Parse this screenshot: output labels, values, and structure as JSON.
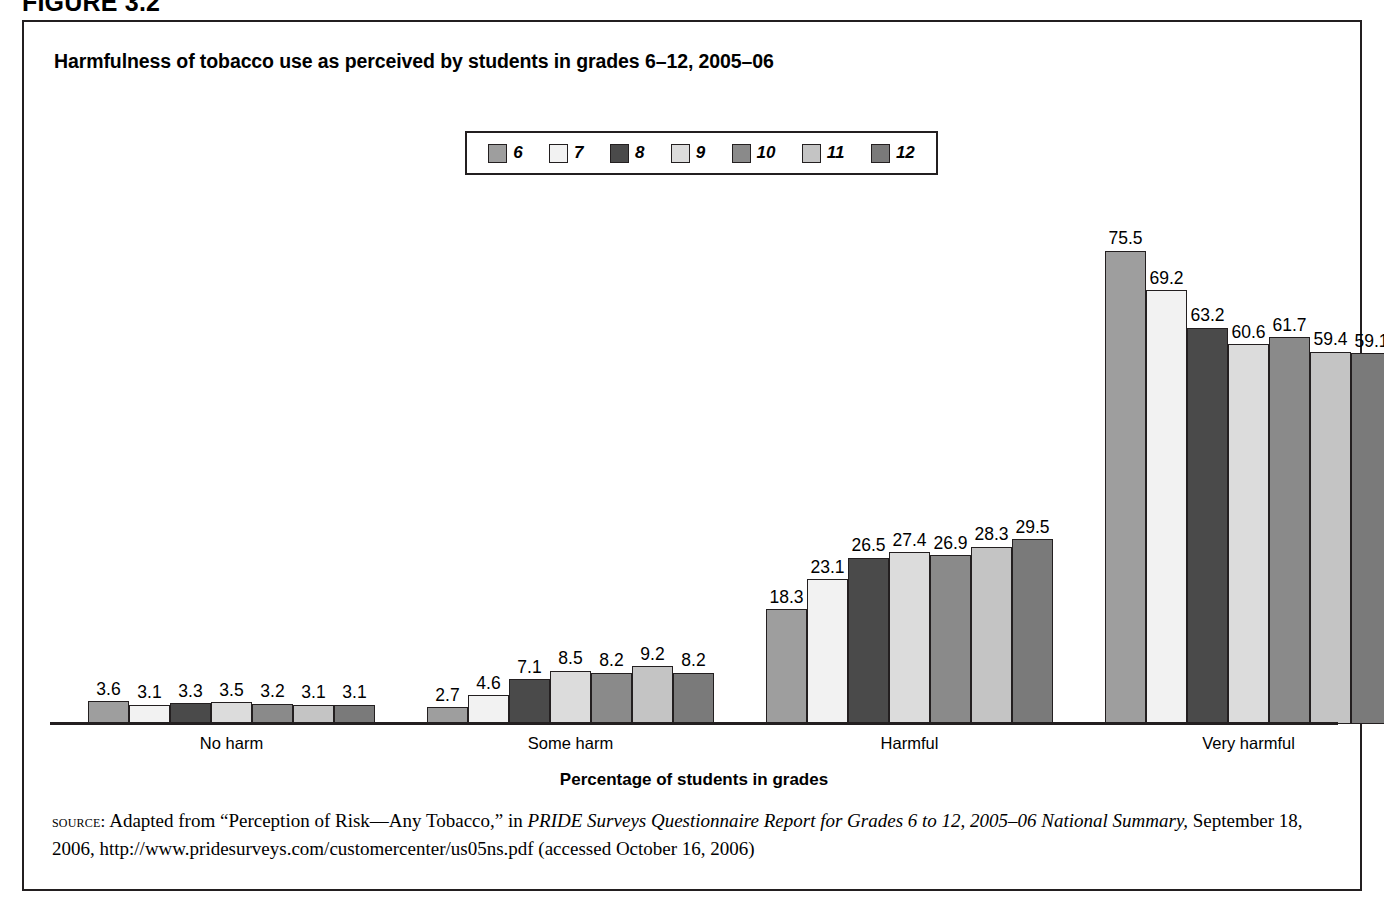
{
  "figure": {
    "header": "FIGURE 3.2",
    "title": "Harmfulness of tobacco use as perceived by students in grades 6–12, 2005–06"
  },
  "legend": {
    "position": "top-center",
    "items": [
      {
        "label": "6",
        "color": "#9e9e9e"
      },
      {
        "label": "7",
        "color": "#f2f2f2"
      },
      {
        "label": "8",
        "color": "#4a4a4a"
      },
      {
        "label": "9",
        "color": "#dcdcdc"
      },
      {
        "label": "10",
        "color": "#8a8a8a"
      },
      {
        "label": "11",
        "color": "#c4c4c4"
      },
      {
        "label": "12",
        "color": "#7a7a7a"
      }
    ]
  },
  "axis": {
    "x_title": "Percentage of students in grades"
  },
  "source": {
    "label": "source:",
    "line1_pre": " Adapted from “Perception of Risk—Any Tobacco,” in ",
    "line1_italic": "PRIDE Surveys Questionnaire Report for Grades 6 to 12, 2005–06 National Summary,",
    "line2": "September 18, 2006, http://www.pridesurveys.com/customercenter/us05ns.pdf (accessed October 16, 2006)"
  },
  "chart_data": {
    "type": "bar",
    "title": "Harmfulness of tobacco use as perceived by students in grades 6–12, 2005–06",
    "xlabel": "Percentage of students in grades",
    "ylabel": "",
    "ylim": [
      0,
      80
    ],
    "grid": false,
    "legend_position": "top-center",
    "categories": [
      "No harm",
      "Some harm",
      "Harmful",
      "Very harmful"
    ],
    "series": [
      {
        "name": "6",
        "color": "#9e9e9e",
        "values": [
          3.6,
          2.7,
          18.3,
          75.5
        ]
      },
      {
        "name": "7",
        "color": "#f2f2f2",
        "values": [
          3.1,
          4.6,
          23.1,
          69.2
        ]
      },
      {
        "name": "8",
        "color": "#4a4a4a",
        "values": [
          3.3,
          7.1,
          26.5,
          63.2
        ]
      },
      {
        "name": "9",
        "color": "#dcdcdc",
        "values": [
          3.5,
          8.5,
          27.4,
          60.6
        ]
      },
      {
        "name": "10",
        "color": "#8a8a8a",
        "values": [
          3.2,
          8.2,
          26.9,
          61.7
        ]
      },
      {
        "name": "11",
        "color": "#c4c4c4",
        "values": [
          3.1,
          9.2,
          28.3,
          59.4
        ]
      },
      {
        "name": "12",
        "color": "#7a7a7a",
        "values": [
          3.1,
          8.2,
          29.5,
          59.1
        ]
      }
    ]
  }
}
